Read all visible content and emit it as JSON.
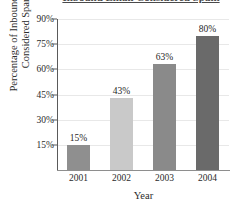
{
  "chart_data": {
    "type": "bar",
    "title": "Inbound Email Considered Spam",
    "title_visible": false,
    "categories": [
      "2001",
      "2002",
      "2003",
      "2004"
    ],
    "values": [
      15,
      43,
      63,
      80
    ],
    "data_labels": [
      "15%",
      "43%",
      "63%",
      "80%"
    ],
    "xlabel": "Year",
    "ylabel_line1": "Percentage of Inbound email",
    "ylabel_line2": "Considered Spam",
    "ylim": [
      0,
      90
    ],
    "yticks": [
      15,
      30,
      45,
      60,
      75,
      90
    ],
    "ytick_labels": [
      "15%",
      "30%",
      "45%",
      "60%",
      "75%",
      "90%"
    ],
    "grid": true,
    "legend": false,
    "bar_colors": [
      "#8f8f8f",
      "#c9c9c9",
      "#8a8a8a",
      "#6a6a6a"
    ],
    "axis_color": "#5a5a5a",
    "grid_color": "#e8e8e8",
    "text_color": "#2b2b2b",
    "background": "#ffffff"
  }
}
